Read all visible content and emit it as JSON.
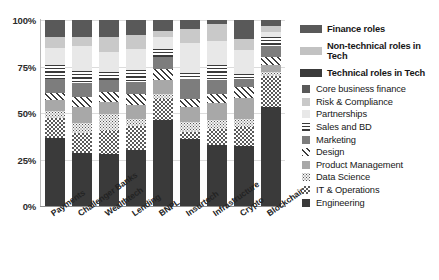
{
  "title_sliver": "",
  "axis": {
    "y_ticks": [
      "100%",
      "75%",
      "50%",
      "25%",
      "0%"
    ],
    "y_tick_values": [
      100,
      75,
      50,
      25,
      0
    ],
    "ylabel": "",
    "xlabel": ""
  },
  "legend_groups": [
    {
      "label": "Finance roles",
      "swatch": "sw-fin",
      "color": "#595959"
    },
    {
      "label": "Non-technical roles in Tech",
      "swatch": "sw-nontech",
      "color": "#c2c2c2"
    },
    {
      "label": "Technical roles in Tech",
      "swatch": "sw-tech",
      "color": "#3a3a3a"
    }
  ],
  "legend_items": [
    {
      "label": "Core business finance",
      "pattern": "p-core",
      "icon": "solid-square-swatch"
    },
    {
      "label": "Risk & Compliance",
      "pattern": "p-risk",
      "icon": "solid-square-swatch"
    },
    {
      "label": "Partnerships",
      "pattern": "p-part",
      "icon": "solid-square-swatch"
    },
    {
      "label": "Sales and BD",
      "pattern": "p-sales",
      "icon": "horizontal-stripe-swatch"
    },
    {
      "label": "Marketing",
      "pattern": "p-mkt",
      "icon": "solid-square-swatch"
    },
    {
      "label": "Design",
      "pattern": "p-design",
      "icon": "diagonal-hatch-swatch"
    },
    {
      "label": "Product Management",
      "pattern": "p-pm",
      "icon": "solid-square-swatch"
    },
    {
      "label": "Data Science",
      "pattern": "p-ds",
      "icon": "dotted-swatch"
    },
    {
      "label": "IT & Operations",
      "pattern": "p-it",
      "icon": "checkerboard-swatch"
    },
    {
      "label": "Engineering",
      "pattern": "p-eng",
      "icon": "solid-square-swatch"
    }
  ],
  "chart_data": {
    "type": "bar",
    "subtype": "stacked-100-percent",
    "title": "",
    "xlabel": "",
    "ylabel": "",
    "ylim": [
      0,
      100
    ],
    "grid": true,
    "legend_position": "right",
    "categories": [
      "Payments",
      "Challenger Banks",
      "Wealthtech",
      "Lending",
      "BNPL",
      "Insurtech",
      "Infrastructure",
      "Crypto",
      "Blockchain"
    ],
    "series": [
      {
        "name": "Engineering",
        "pattern": "p-eng",
        "values": [
          36.5,
          28.5,
          28.0,
          30.0,
          46.0,
          36.0,
          33.0,
          32.5,
          53.0
        ]
      },
      {
        "name": "IT & Operations",
        "pattern": "p-it",
        "values": [
          11.0,
          10.5,
          12.5,
          13.0,
          11.5,
          4.0,
          8.5,
          10.0,
          17.0
        ]
      },
      {
        "name": "Data Science",
        "pattern": "p-ds",
        "values": [
          3.5,
          5.5,
          9.0,
          4.0,
          3.0,
          5.0,
          5.0,
          4.5,
          2.0
        ]
      },
      {
        "name": "Product Management",
        "pattern": "p-pm",
        "values": [
          6.0,
          9.0,
          6.5,
          7.5,
          7.0,
          8.0,
          9.0,
          11.0,
          4.0
        ]
      },
      {
        "name": "Design",
        "pattern": "p-design",
        "values": [
          4.0,
          5.0,
          5.5,
          5.5,
          6.0,
          4.5,
          5.0,
          6.0,
          4.0
        ]
      },
      {
        "name": "Marketing",
        "pattern": "p-mkt",
        "values": [
          7.5,
          7.5,
          6.5,
          6.5,
          6.5,
          11.0,
          7.5,
          4.5,
          6.0
        ]
      },
      {
        "name": "Sales and BD",
        "pattern": "p-sales",
        "values": [
          7.5,
          6.5,
          4.5,
          6.5,
          4.5,
          3.0,
          8.0,
          2.5,
          5.0
        ]
      },
      {
        "name": "Partnerships",
        "pattern": "p-part",
        "values": [
          9.0,
          13.5,
          10.5,
          11.5,
          6.5,
          16.0,
          13.0,
          13.0,
          2.5
        ]
      },
      {
        "name": "Risk & Compliance",
        "pattern": "p-risk",
        "values": [
          6.0,
          5.0,
          8.5,
          7.5,
          3.0,
          7.5,
          9.0,
          6.0,
          3.5
        ]
      },
      {
        "name": "Core business finance",
        "pattern": "p-core",
        "values": [
          9.0,
          9.0,
          9.0,
          8.0,
          6.0,
          5.0,
          2.0,
          10.0,
          3.0
        ]
      }
    ]
  }
}
